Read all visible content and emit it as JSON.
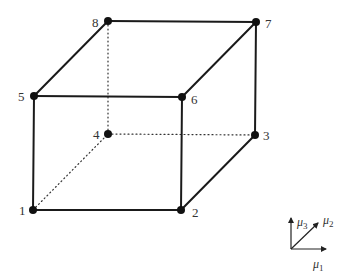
{
  "diagram": {
    "title": "",
    "nodes": [
      {
        "id": "1",
        "label": "1",
        "x": 33,
        "y": 210,
        "lx": 19,
        "ly": 215
      },
      {
        "id": "2",
        "label": "2",
        "x": 181,
        "y": 210,
        "lx": 192,
        "ly": 217
      },
      {
        "id": "3",
        "label": "3",
        "x": 255,
        "y": 135,
        "lx": 263,
        "ly": 140
      },
      {
        "id": "4",
        "label": "4",
        "x": 108,
        "y": 134,
        "lx": 93,
        "ly": 139
      },
      {
        "id": "5",
        "label": "5",
        "x": 34,
        "y": 96,
        "lx": 18,
        "ly": 101
      },
      {
        "id": "6",
        "label": "6",
        "x": 182,
        "y": 97,
        "lx": 191,
        "ly": 104
      },
      {
        "id": "7",
        "label": "7",
        "x": 256,
        "y": 22,
        "lx": 265,
        "ly": 28
      },
      {
        "id": "8",
        "label": "8",
        "x": 108,
        "y": 21,
        "lx": 92,
        "ly": 27
      }
    ],
    "solid_edges": [
      [
        "1",
        "2"
      ],
      [
        "2",
        "6"
      ],
      [
        "6",
        "5"
      ],
      [
        "5",
        "1"
      ],
      [
        "5",
        "8"
      ],
      [
        "8",
        "7"
      ],
      [
        "7",
        "6"
      ],
      [
        "7",
        "3"
      ],
      [
        "3",
        "2"
      ]
    ],
    "hidden_edges": [
      [
        "1",
        "4"
      ],
      [
        "4",
        "3"
      ],
      [
        "4",
        "8"
      ]
    ],
    "axes": {
      "origin": {
        "x": 291,
        "y": 249
      },
      "mu1": {
        "label": "μ",
        "sub": "1",
        "tip": {
          "x": 326,
          "y": 249
        },
        "lx": 313,
        "ly": 268
      },
      "mu2": {
        "label": "μ",
        "sub": "2",
        "tip": {
          "x": 318,
          "y": 223
        },
        "lx": 323,
        "ly": 224
      },
      "mu3": {
        "label": "μ",
        "sub": "3",
        "tip": {
          "x": 291,
          "y": 218
        },
        "lx": 297,
        "ly": 226
      }
    }
  }
}
